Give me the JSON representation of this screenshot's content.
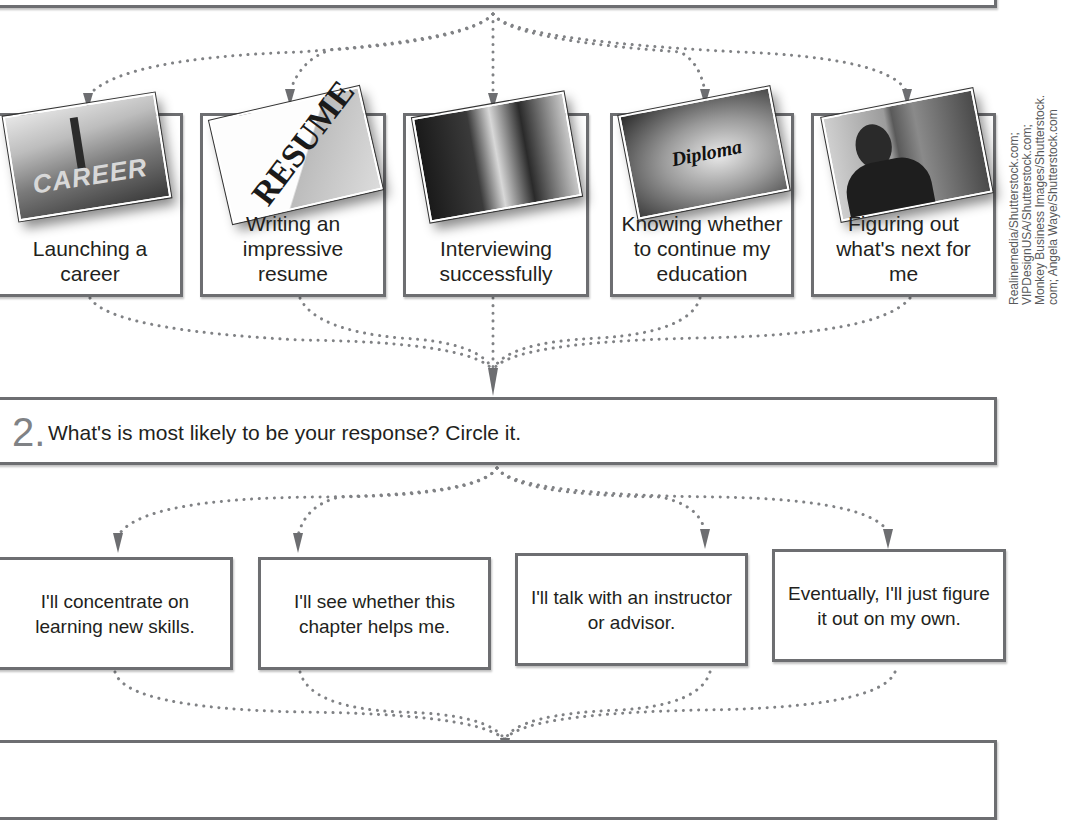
{
  "diagram": {
    "step1": {
      "cards": [
        {
          "label": "Launching a career",
          "photo": "career-road-photo",
          "photo_caption": "CAREER"
        },
        {
          "label": "Writing an impressive resume",
          "photo": "resume-clip-photo",
          "photo_caption": "RESUME"
        },
        {
          "label": "Interviewing successfully",
          "photo": "job-interview-photo",
          "photo_caption": ""
        },
        {
          "label": "Knowing whether to continue my education",
          "photo": "diploma-photo",
          "photo_caption": "Diploma"
        },
        {
          "label": "Figuring out what's next for me",
          "photo": "student-thinking-photo",
          "photo_caption": ""
        }
      ]
    },
    "step2": {
      "number": "2.",
      "prompt": "What's is most likely to be your response? Circle it.",
      "responses": [
        "I'll concentrate on learning new skills.",
        "I'll see whether this chapter helps me.",
        "I'll talk with an instructor or advisor.",
        "Eventually, I'll just figure it out on my own."
      ]
    },
    "photo_credit": {
      "lines": [
        "Realinemedia/Shutterstock.com;",
        "VIPDesignUSA/Shutterstock.com;",
        "Monkey Business Images/Shutterstock.",
        "com; Angela Waye/Shutterstock.com"
      ]
    },
    "colors": {
      "border": "#6d6e71",
      "arrow": "#6d6e71",
      "dots": "#808285",
      "step_number": "#808285",
      "text": "#231f20"
    }
  }
}
